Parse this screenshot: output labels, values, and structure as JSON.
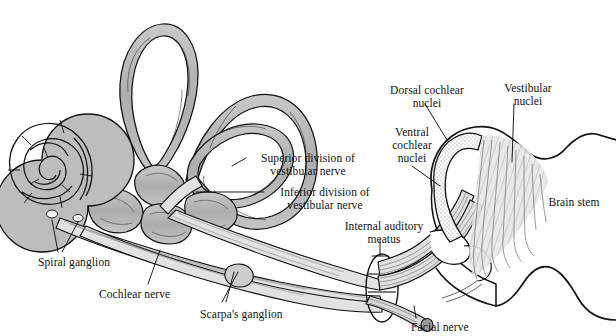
{
  "figure": {
    "background": "#ffffff",
    "ink": "#111111",
    "fill_gray": "#b6b6b6",
    "fill_gray_light": "#d2d2d2",
    "stipple_gray": "#8a8a8a"
  },
  "labels": [
    {
      "id": "dorsal-cochlear-nuclei",
      "text": "Dorsal cochlear\nnuclei",
      "x": 372,
      "y": 84,
      "w": 110,
      "align": "center"
    },
    {
      "id": "vestibular-nuclei",
      "text": "Vestibular\nnuclei",
      "x": 480,
      "y": 82,
      "w": 96,
      "align": "center"
    },
    {
      "id": "ventral-cochlear-nuclei",
      "text": "Ventral\ncochlear\nnuclei",
      "x": 370,
      "y": 126,
      "w": 84,
      "align": "center"
    },
    {
      "id": "superior-division",
      "text": "Superior division of\nvestibular nerve",
      "x": 248,
      "y": 152,
      "w": 116,
      "align": "center"
    },
    {
      "id": "inferior-division",
      "text": "Inferior division of\nvestibular nerve",
      "x": 266,
      "y": 186,
      "w": 116,
      "align": "center"
    },
    {
      "id": "internal-auditory-meatus",
      "text": "Internal auditory\nmeatus",
      "x": 330,
      "y": 220,
      "w": 110,
      "align": "center"
    },
    {
      "id": "brain-stem",
      "text": "Brain stem",
      "x": 537,
      "y": 196,
      "w": 74,
      "align": "center"
    },
    {
      "id": "spiral-ganglion",
      "text": "Spiral ganglion",
      "x": 38,
      "y": 256,
      "w": 96,
      "align": "left"
    },
    {
      "id": "cochlear-nerve",
      "text": "Cochlear nerve",
      "x": 99,
      "y": 288,
      "w": 98,
      "align": "left"
    },
    {
      "id": "scarpas-ganglion",
      "text": "Scarpa's ganglion",
      "x": 200,
      "y": 308,
      "w": 110,
      "align": "left"
    },
    {
      "id": "facial-nerve",
      "text": "Facial nerve",
      "x": 411,
      "y": 321,
      "w": 84,
      "align": "left"
    }
  ]
}
